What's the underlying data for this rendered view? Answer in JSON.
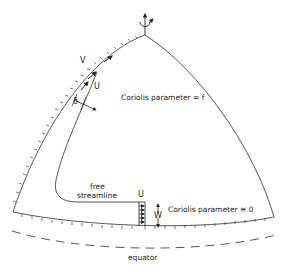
{
  "diagram": {
    "labels": {
      "v": "V",
      "u_top": "U",
      "delta": "δ",
      "coriolis_f": "Coriolis parameter = f",
      "free": "free",
      "streamline": "streamline",
      "u_bottom": "U",
      "w": "W",
      "coriolis_zero": "Coriolis parameter ≅ 0",
      "equator": "equator"
    },
    "colors": {
      "line": "#333333",
      "background": "#ffffff"
    }
  }
}
